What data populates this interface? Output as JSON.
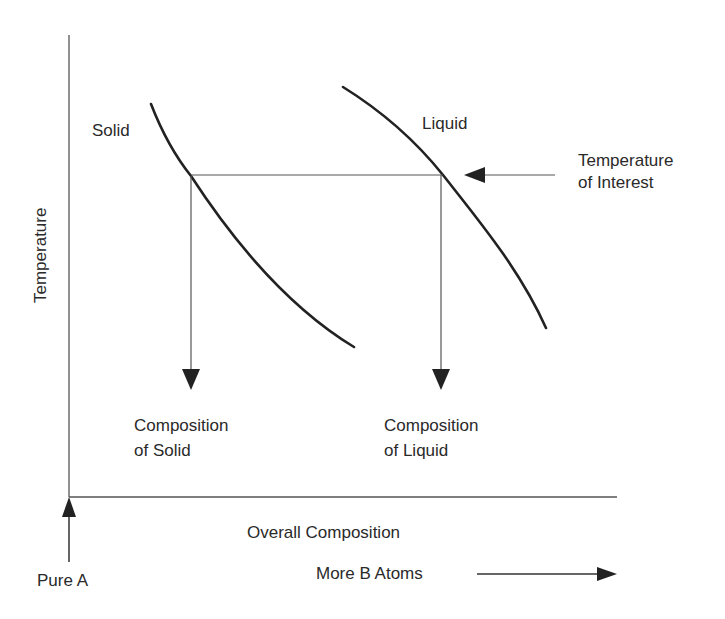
{
  "diagram": {
    "type": "phase-diagram-schematic",
    "axes": {
      "y_label": "Temperature",
      "x_label": "Overall Composition",
      "x_origin_label": "Pure A",
      "x_direction_label": "More B Atoms"
    },
    "curves": [
      {
        "name": "Solid",
        "label": "Solid"
      },
      {
        "name": "Liquid",
        "label": "Liquid"
      }
    ],
    "annotations": {
      "temperature_of_interest": [
        "Temperature",
        "of Interest"
      ],
      "composition_of_solid": [
        "Composition",
        "of Solid"
      ],
      "composition_of_liquid": [
        "Composition",
        "of Liquid"
      ]
    },
    "colors": {
      "ink": "#2a2a2a",
      "axis": "#555555",
      "background": "#ffffff"
    }
  }
}
